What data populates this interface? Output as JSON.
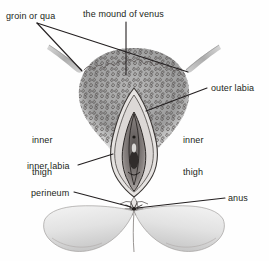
{
  "figure": {
    "kind": "anatomical-illustration",
    "style": "pencil and ink line drawing with grey wash shading",
    "background_color": "#fefefe",
    "ink_color": "#231f20",
    "shading_color": "#8d8d8d",
    "width": 269,
    "height": 261
  },
  "labels": {
    "groin": "groin or qua",
    "mound_of_venus": "the mound of venus",
    "outer_labia": "outer labia",
    "inner_thigh_left_line1": "inner",
    "inner_thigh_left_line2": "thigh",
    "inner_thigh_right_line1": "inner",
    "inner_thigh_right_line2": "thigh",
    "inner_labia": "inner labia",
    "perineum": "perineum",
    "anus": "anus"
  }
}
